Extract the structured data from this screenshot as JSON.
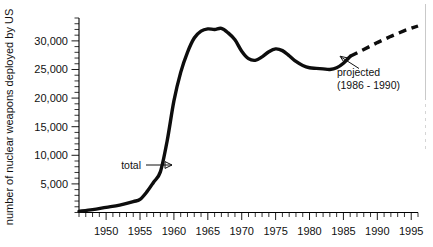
{
  "chart_data": {
    "type": "line",
    "title": "",
    "subtitle": "",
    "xlabel": "",
    "ylabel": "number of nuclear weapons deployed by US",
    "xlim": [
      1946,
      1996
    ],
    "ylim": [
      0,
      34000
    ],
    "grid": false,
    "legend_position": "none",
    "x_tick_labels": [
      "1950",
      "1955",
      "1960",
      "1965",
      "1970",
      "1975",
      "1980",
      "1985",
      "1990",
      "1995"
    ],
    "x_tick_values": [
      1950,
      1955,
      1960,
      1965,
      1970,
      1975,
      1980,
      1985,
      1990,
      1995
    ],
    "x_minor_tick_interval": 1,
    "y_tick_labels": [
      "5,000",
      "10,000",
      "15,000",
      "20,000",
      "25,000",
      "30,000"
    ],
    "y_tick_values": [
      5000,
      10000,
      15000,
      20000,
      25000,
      30000
    ],
    "y_minor_tick_interval": 1000,
    "series": [
      {
        "name": "total",
        "style": "solid",
        "x": [
          1946,
          1948,
          1950,
          1952,
          1954,
          1955,
          1956,
          1957,
          1958,
          1959,
          1960,
          1961,
          1962,
          1963,
          1964,
          1965,
          1966,
          1967,
          1968,
          1969,
          1970,
          1971,
          1972,
          1973,
          1974,
          1975,
          1976,
          1977,
          1978,
          1979,
          1980,
          1981,
          1982,
          1983,
          1984,
          1985,
          1986
        ],
        "y": [
          200,
          500,
          900,
          1300,
          1900,
          2300,
          3600,
          5300,
          7100,
          12500,
          19500,
          24500,
          28000,
          30500,
          31700,
          32100,
          32000,
          32200,
          31400,
          30200,
          28200,
          26900,
          26600,
          27200,
          28100,
          28600,
          28300,
          27400,
          26400,
          25700,
          25300,
          25200,
          25100,
          25000,
          25300,
          26100,
          27300
        ]
      },
      {
        "name": "projected (1986 - 1990)",
        "style": "dashed",
        "x": [
          1986,
          1988,
          1990,
          1992,
          1994,
          1996
        ],
        "y": [
          27300,
          28500,
          29700,
          30800,
          31800,
          32600
        ]
      }
    ],
    "annotations": [
      {
        "name": "total",
        "text": "total",
        "x": 1955.3,
        "y": 7200,
        "arrow_to_x": 1958.5,
        "arrow_to_y": 7400
      },
      {
        "name": "projected",
        "text_line_1": "projected",
        "text_line_2": "(1986 - 1990)",
        "x": 1988.2,
        "y": 23200,
        "arrow_to_x": 1986.6,
        "arrow_to_y": 27000
      }
    ]
  }
}
